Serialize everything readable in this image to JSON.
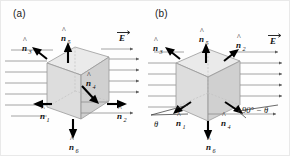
{
  "figure": {
    "background_color": "#fefefe",
    "field_line_color": "#8d8d8d",
    "vector_color": "#000000",
    "face_fill_color": "#d2d2d2"
  },
  "panels": [
    {
      "id": "a",
      "label": "(a)",
      "description": "Cube with faces perpendicular/parallel to the uniform field E",
      "field_label": "E",
      "field_label_accent": "vector-arrow",
      "field_line_count": 7,
      "field_direction": "left-to-right",
      "normals": [
        {
          "name": "n1",
          "base": "n",
          "subscript": "1",
          "accent": "hat",
          "direction": "left",
          "label_x": 40,
          "label_y": 116
        },
        {
          "name": "n2",
          "base": "n",
          "subscript": "2",
          "accent": "hat",
          "direction": "right",
          "label_x": 117,
          "label_y": 116
        },
        {
          "name": "n3",
          "base": "n",
          "subscript": "3",
          "accent": "hat",
          "direction": "up-left",
          "label_x": 22,
          "label_y": 48
        },
        {
          "name": "n4",
          "base": "n",
          "subscript": "4",
          "accent": "hat",
          "direction": "down-right",
          "label_x": 86,
          "label_y": 91
        },
        {
          "name": "n5",
          "base": "n",
          "subscript": "5",
          "accent": "hat",
          "direction": "up",
          "label_x": 63,
          "label_y": 40
        },
        {
          "name": "n6",
          "base": "n",
          "subscript": "6",
          "accent": "hat",
          "direction": "down",
          "label_x": 69,
          "label_y": 147
        }
      ],
      "angles": []
    },
    {
      "id": "b",
      "label": "(b)",
      "description": "Cube rotated by angle theta relative to the uniform field E",
      "field_label": "E",
      "field_label_accent": "vector-arrow",
      "field_line_count": 7,
      "field_direction": "left-to-right",
      "normals": [
        {
          "name": "n1",
          "base": "n",
          "subscript": "1",
          "accent": "hat",
          "direction": "down-left",
          "label_x": 31,
          "label_y": 123
        },
        {
          "name": "n2",
          "base": "n",
          "subscript": "2",
          "accent": "hat",
          "direction": "up-right",
          "label_x": 91,
          "label_y": 45
        },
        {
          "name": "n3",
          "base": "n",
          "subscript": "3",
          "accent": "hat",
          "direction": "up-left",
          "label_x": 8,
          "label_y": 48
        },
        {
          "name": "n4",
          "base": "n",
          "subscript": "4",
          "accent": "hat",
          "direction": "down-right",
          "label_x": 76,
          "label_y": 123
        },
        {
          "name": "n5",
          "base": "n",
          "subscript": "5",
          "accent": "hat",
          "direction": "up",
          "label_x": 56,
          "label_y": 40
        },
        {
          "name": "n6",
          "base": "n",
          "subscript": "6",
          "accent": "hat",
          "direction": "down",
          "label_x": 61,
          "label_y": 147
        }
      ],
      "angles": [
        {
          "name": "theta",
          "text": "θ",
          "label_x": 9,
          "label_y": 125
        },
        {
          "name": "ninety-minus-theta",
          "text": "90° − θ",
          "label_x": 96,
          "label_y": 112
        }
      ]
    }
  ]
}
